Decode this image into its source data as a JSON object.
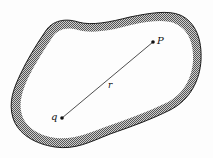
{
  "figure": {
    "labels": {
      "point_p": "P",
      "charge_q": "q",
      "distance_r": "r"
    },
    "points": {
      "P": {
        "x": 153,
        "y": 42
      },
      "q": {
        "x": 62,
        "y": 118
      }
    },
    "colors": {
      "outline": "#1a1a1a",
      "hatch_dark": "#555555",
      "hatch_light": "#cfcfcf",
      "interior": "#fdfdfd",
      "line": "#222222"
    }
  }
}
